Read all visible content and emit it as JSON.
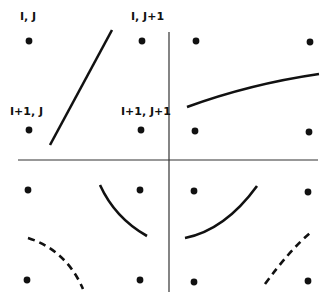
{
  "diagram": {
    "node_labels": {
      "top_left": "I, J",
      "top_right": "I, J+1",
      "bottom_left": "I+1, J",
      "bottom_right": "I+1, J+1"
    },
    "panels": [
      {
        "id": "top-left",
        "case": "single line crossing from left-bottom to top-right",
        "style": [
          "solid"
        ]
      },
      {
        "id": "top-right",
        "case": "single line crossing left to right edge",
        "style": [
          "solid"
        ]
      },
      {
        "id": "bottom-left",
        "case": "two curves cutting opposite corners",
        "style": [
          "solid",
          "dashed"
        ]
      },
      {
        "id": "bottom-right",
        "case": "two curves cutting opposite corners",
        "style": [
          "solid",
          "dashed"
        ]
      }
    ],
    "colors": {
      "ink": "#111111",
      "divider": "#333333",
      "background": "#ffffff"
    }
  }
}
